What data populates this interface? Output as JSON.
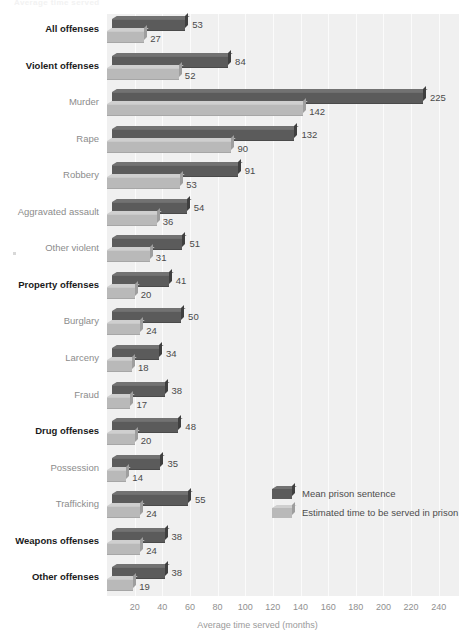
{
  "top_caption": "Average time served",
  "chart_data": {
    "type": "bar",
    "orientation": "horizontal",
    "title": "",
    "xlabel": "Average time served (months)",
    "ylabel": "",
    "xlim": [
      0,
      250
    ],
    "xticks": [
      20,
      40,
      60,
      80,
      100,
      120,
      140,
      160,
      180,
      200,
      220,
      240
    ],
    "grid": true,
    "legend_position": "lower-right",
    "series": [
      {
        "name": "Mean prison sentence",
        "color": "#5b5b5b",
        "values": [
          53,
          84,
          225,
          132,
          91,
          54,
          51,
          41,
          50,
          34,
          38,
          48,
          35,
          55,
          38,
          38
        ]
      },
      {
        "name": "Estimated time to be served in prison",
        "color": "#b9b9b9",
        "values": [
          27,
          52,
          142,
          90,
          53,
          36,
          31,
          20,
          24,
          18,
          17,
          20,
          14,
          24,
          24,
          19
        ]
      }
    ],
    "categories": [
      "All offenses",
      "Violent offenses",
      "Murder",
      "Rape",
      "Robbery",
      "Aggravated assault",
      "Other violent",
      "Property offenses",
      "Burglary",
      "Larceny",
      "Fraud",
      "Drug offenses",
      "Possession",
      "Trafficking",
      "Weapons offenses",
      "Other offenses"
    ],
    "category_emphasis": [
      true,
      true,
      false,
      false,
      false,
      false,
      false,
      true,
      false,
      false,
      false,
      true,
      false,
      false,
      true,
      true
    ]
  }
}
